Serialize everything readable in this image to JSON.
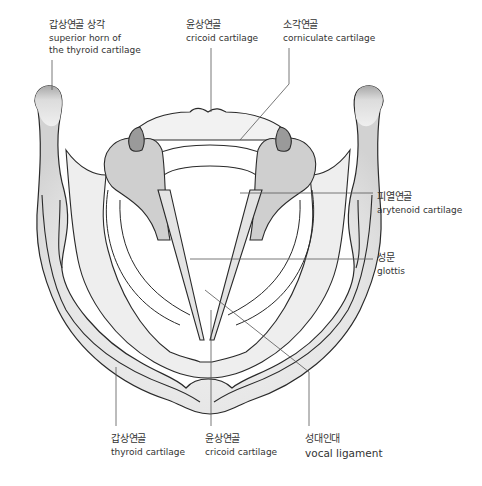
{
  "figure": {
    "colors": {
      "outline": "#2a2a2a",
      "cartilage_light": "#ececec",
      "cartilage_mid": "#d6d6d6",
      "arytenoid_fill": "#c8c8c8",
      "corniculate_fill": "#9a9a9a",
      "leader_line": "#555555",
      "text": "#333333"
    }
  },
  "labels": {
    "horn": {
      "ko": "갑상연골 상각",
      "en_line1": "superior horn of",
      "en_line2": "the thyroid cartilage"
    },
    "cricoid_top": {
      "ko": "윤상연골",
      "en": "cricoid cartilage"
    },
    "corniculate": {
      "ko": "소각연골",
      "en": "corniculate cartilage"
    },
    "arytenoid": {
      "ko": "피열연골",
      "en": "arytenoid cartilage"
    },
    "glottis": {
      "ko": "성문",
      "en": "glottis"
    },
    "thyroid": {
      "ko": "갑상연골",
      "en": "thyroid cartilage"
    },
    "cricoid_bottom": {
      "ko": "윤상연골",
      "en": "cricoid cartilage"
    },
    "vocal": {
      "ko": "성대인대",
      "en": "vocal ligament"
    }
  }
}
